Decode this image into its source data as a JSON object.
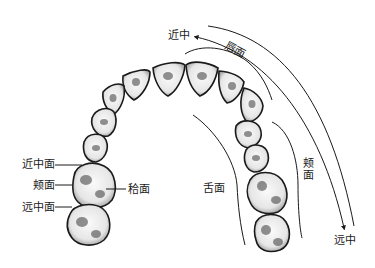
{
  "figure": {
    "labels": {
      "mesial_top": "近中",
      "labial": "唇面",
      "buccal_right_line1": "颊",
      "buccal_right_line2": "面",
      "lingual": "舌面",
      "distal_bottom": "远中",
      "mesial_surface": "近中面",
      "buccal_surface": "颊面",
      "distal_surface": "远中面",
      "occlusal_surface": "秴面"
    },
    "colors": {
      "ink": "#1a1a1a",
      "tooth_fill": "#f4f4f4",
      "shade": "#3a3a3a",
      "background": "#ffffff"
    }
  }
}
